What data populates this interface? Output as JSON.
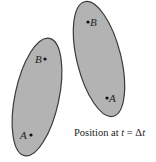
{
  "diagram": {
    "colors": {
      "body_fill": "#b3b3b3",
      "body_stroke": "#3a3a3a",
      "text": "#222222",
      "background": "#ffffff"
    },
    "bodies": [
      {
        "name": "initial-position-body",
        "points": [
          {
            "label": "B",
            "x": 45,
            "y": 59
          },
          {
            "label": "A",
            "x": 31,
            "y": 135
          }
        ]
      },
      {
        "name": "later-position-body",
        "points": [
          {
            "label": "B",
            "x": 88,
            "y": 22
          },
          {
            "label": "A",
            "x": 107,
            "y": 98
          }
        ]
      }
    ],
    "caption": {
      "prefix": "Position at ",
      "var": "t",
      "eq": " = Δ",
      "var2": "t"
    }
  }
}
